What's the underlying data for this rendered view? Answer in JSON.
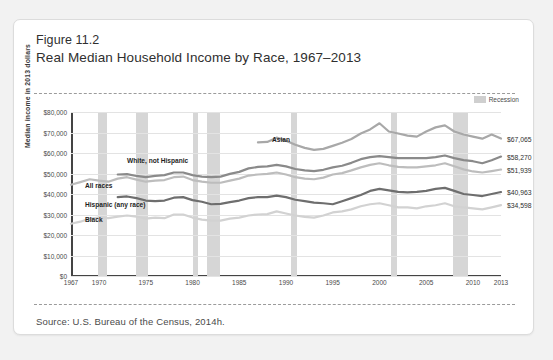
{
  "figure": {
    "number": "Figure 11.2",
    "title": "Real Median Household Income by Race, 1967–2013",
    "source": "Source: U.S. Bureau of the Census, 2014h."
  },
  "legend": {
    "recession_label": "Recession",
    "recession_color": "#d6d6d6"
  },
  "chart_data": {
    "type": "line",
    "title": "Real Median Household Income by Race, 1967–2013",
    "xlabel": "",
    "ylabel": "Median income in 2013 dollars",
    "xlim": [
      1967,
      2013
    ],
    "ylim": [
      0,
      80000
    ],
    "grid": true,
    "legend_position": "inline-labels",
    "ytick_labels": [
      "$0",
      "$10,000",
      "$20,000",
      "$30,000",
      "$40,000",
      "$50,000",
      "$60,000",
      "$70,000",
      "$80,000"
    ],
    "ytick_values": [
      0,
      10000,
      20000,
      30000,
      40000,
      50000,
      60000,
      70000,
      80000
    ],
    "xtick_labels": [
      "1967",
      "1970",
      "1975",
      "1980",
      "1985",
      "1990",
      "1995",
      "2000",
      "2005",
      "2010",
      "2013"
    ],
    "xtick_values": [
      1967,
      1970,
      1975,
      1980,
      1985,
      1990,
      1995,
      2000,
      2005,
      2010,
      2013
    ],
    "recession_bands": [
      {
        "start": 1969.9,
        "end": 1970.9
      },
      {
        "start": 1973.9,
        "end": 1975.2
      },
      {
        "start": 1980.0,
        "end": 1980.6
      },
      {
        "start": 1981.5,
        "end": 1982.9
      },
      {
        "start": 1990.5,
        "end": 1991.2
      },
      {
        "start": 2001.2,
        "end": 2001.9
      },
      {
        "start": 2007.9,
        "end": 2009.5
      }
    ],
    "series": [
      {
        "name": "Asian",
        "color": "#a8a8a8",
        "label_x": 1988.5,
        "label_y": 66500,
        "end_label": "$67,065",
        "x": [
          1987,
          1988,
          1989,
          1990,
          1991,
          1992,
          1993,
          1994,
          1995,
          1996,
          1997,
          1998,
          1999,
          2000,
          2001,
          2002,
          2003,
          2004,
          2005,
          2006,
          2007,
          2008,
          2009,
          2010,
          2011,
          2012,
          2013
        ],
        "y": [
          65200,
          65400,
          67500,
          66000,
          64000,
          62500,
          61500,
          62000,
          63500,
          65000,
          66800,
          69500,
          71500,
          74500,
          70500,
          69500,
          68500,
          68000,
          70500,
          72500,
          73500,
          70500,
          69000,
          68000,
          67000,
          69000,
          67065
        ]
      },
      {
        "name": "White, not Hispanic",
        "color": "#8a8a8a",
        "label_x": 1973.0,
        "label_y": 56200,
        "end_label": "$58,270",
        "x": [
          1972,
          1973,
          1974,
          1975,
          1976,
          1977,
          1978,
          1979,
          1980,
          1981,
          1982,
          1983,
          1984,
          1985,
          1986,
          1987,
          1988,
          1989,
          1990,
          1991,
          1992,
          1993,
          1994,
          1995,
          1996,
          1997,
          1998,
          1999,
          2000,
          2001,
          2002,
          2003,
          2004,
          2005,
          2006,
          2007,
          2008,
          2009,
          2010,
          2011,
          2012,
          2013
        ],
        "y": [
          49500,
          49700,
          48800,
          48200,
          48800,
          49200,
          50500,
          50500,
          49200,
          48500,
          48200,
          48500,
          49800,
          50800,
          52500,
          53200,
          53500,
          54200,
          53500,
          52200,
          51500,
          51200,
          51800,
          53000,
          53800,
          55200,
          57000,
          58000,
          58500,
          58000,
          57500,
          57500,
          57500,
          57500,
          58000,
          58800,
          57500,
          56500,
          56000,
          55000,
          56500,
          58270
        ]
      },
      {
        "name": "All races",
        "color": "#bdbdbd",
        "label_x": 1968.5,
        "label_y": 44000,
        "end_label": "$51,939",
        "x": [
          1967,
          1968,
          1969,
          1970,
          1971,
          1972,
          1973,
          1974,
          1975,
          1976,
          1977,
          1978,
          1979,
          1980,
          1981,
          1982,
          1983,
          1984,
          1985,
          1986,
          1987,
          1988,
          1989,
          1990,
          1991,
          1992,
          1993,
          1994,
          1995,
          1996,
          1997,
          1998,
          1999,
          2000,
          2001,
          2002,
          2003,
          2004,
          2005,
          2006,
          2007,
          2008,
          2009,
          2010,
          2011,
          2012,
          2013
        ],
        "y": [
          44500,
          45800,
          47200,
          46500,
          46000,
          47500,
          48200,
          47000,
          46000,
          46500,
          46800,
          48200,
          48500,
          46800,
          46000,
          45500,
          45500,
          46500,
          47500,
          49000,
          49500,
          49800,
          50500,
          49500,
          48200,
          47500,
          47200,
          48000,
          49500,
          50200,
          51500,
          53000,
          54200,
          55000,
          54000,
          53200,
          53000,
          53000,
          53500,
          54000,
          55000,
          53500,
          52000,
          51000,
          50500,
          51200,
          51939
        ]
      },
      {
        "name": "Hispanic (any race)",
        "color": "#6e6e6e",
        "label_x": 1968.5,
        "label_y": 34500,
        "end_label": "$40,963",
        "x": [
          1972,
          1973,
          1974,
          1975,
          1976,
          1977,
          1978,
          1979,
          1980,
          1981,
          1982,
          1983,
          1984,
          1985,
          1986,
          1987,
          1988,
          1989,
          1990,
          1991,
          1992,
          1993,
          1994,
          1995,
          1996,
          1997,
          1998,
          1999,
          2000,
          2001,
          2002,
          2003,
          2004,
          2005,
          2006,
          2007,
          2008,
          2009,
          2010,
          2011,
          2012,
          2013
        ],
        "y": [
          38500,
          38800,
          38000,
          36800,
          36500,
          36800,
          38200,
          38500,
          37000,
          36200,
          35000,
          35200,
          36000,
          36800,
          38000,
          38500,
          38500,
          39200,
          38500,
          37200,
          36500,
          35800,
          35500,
          35000,
          36500,
          38000,
          39500,
          41500,
          42500,
          41800,
          41000,
          40800,
          41000,
          41500,
          42500,
          43000,
          41500,
          40000,
          39500,
          39000,
          40000,
          40963
        ]
      },
      {
        "name": "Black",
        "color": "#d2d2d2",
        "label_x": 1968.5,
        "label_y": 27500,
        "end_label": "$34,598",
        "x": [
          1967,
          1968,
          1969,
          1970,
          1971,
          1972,
          1973,
          1974,
          1975,
          1976,
          1977,
          1978,
          1979,
          1980,
          1981,
          1982,
          1983,
          1984,
          1985,
          1986,
          1987,
          1988,
          1989,
          1990,
          1991,
          1992,
          1993,
          1994,
          1995,
          1996,
          1997,
          1998,
          1999,
          2000,
          2001,
          2002,
          2003,
          2004,
          2005,
          2006,
          2007,
          2008,
          2009,
          2010,
          2011,
          2012,
          2013
        ],
        "y": [
          25500,
          26500,
          28000,
          28500,
          28200,
          29000,
          29500,
          29000,
          28000,
          28500,
          28200,
          30000,
          30000,
          28500,
          27500,
          27000,
          27000,
          28000,
          28500,
          29500,
          30000,
          30200,
          31500,
          30500,
          29500,
          28800,
          28500,
          29500,
          31000,
          31500,
          32500,
          34000,
          35000,
          35500,
          34500,
          33500,
          33500,
          33000,
          34000,
          34500,
          35500,
          34000,
          33500,
          33000,
          32500,
          33500,
          34598
        ]
      }
    ]
  }
}
